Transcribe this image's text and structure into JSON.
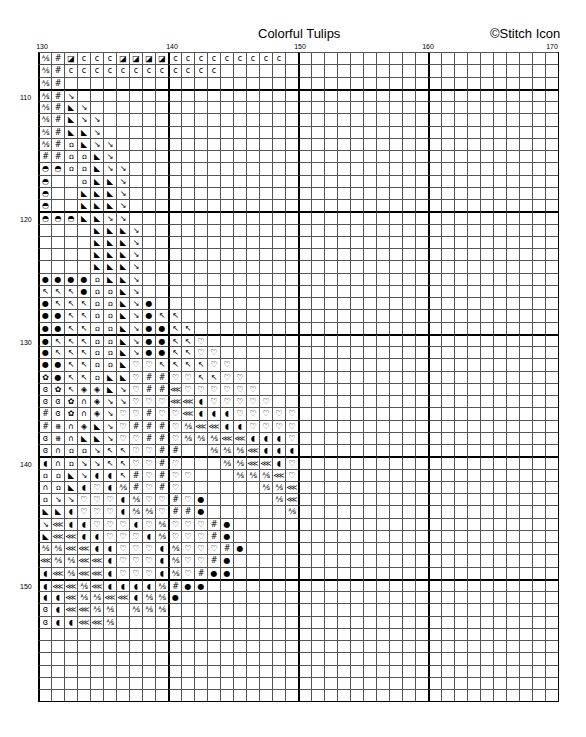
{
  "header": {
    "title": "Colorful Tulips",
    "copyright": "©Stitch Icon"
  },
  "columns": {
    "start": 130,
    "count": 40,
    "labels": [
      130,
      140,
      150,
      160,
      170
    ]
  },
  "rows": {
    "start": 107,
    "count": 53,
    "labels": [
      110,
      120,
      130,
      140,
      150
    ]
  },
  "symbols": {
    "X": "⅍",
    "#": "#",
    "Q": "◪",
    "C": "c",
    "D": "↘",
    "T": "◣",
    "U": "ꭥ",
    "M": "◓",
    "O": "●",
    "N": "↖",
    "H": "♡",
    "F": "✿",
    "S": "ɞ",
    "R": "◈",
    "n": "∩",
    "K": "⋘",
    "B": "◖",
    "P": "⧻",
    "_": ""
  },
  "pattern": [
    "X#QCCCQQQQCCCCCCCCC",
    "X#CCCCCCCCCCCC",
    "X#",
    "X#D",
    "X#TD",
    "X#TDD",
    "X#TTD",
    "X#UTDD",
    "##UUTD",
    "MMUUTDD",
    "M__UTTD",
    "M__TTTD",
    "M__TTTD",
    "MMMTTDD",
    "____TTTD",
    "____TTTD",
    "____TTTD",
    "____TTTD",
    "OOOOUTTD",
    "NNNOUUTD",
    "ONNNUUTDO",
    "OONNUUTDONN",
    "OONNUUTDOONN",
    "ONNNUUTDOONNH",
    "ONNNUUTDOONNHH",
    "OONNUUTHHNNNNHH",
    "FONNUTTH##HHNNHH",
    "SFNRRTDH##KHHHHHH",
    "SSFnRDDHHHKKBHHHHH",
    "#SFnRDHH#HHKBBBHHHHH",
    "#PnRTDH###HXKKBBHHHH",
    "SPnTTDHH##HXXXKKBBBH",
    "SnUUDNNHH##__XXXKBBB",
    "BnUDDNNHH#H___XXKKBH",
    "UUTDBBN#H#HH___XXXKH",
    "nUTBHBX#H#H______XXK",
    "UDDHHHBXHH#HO_____XK",
    "TTBHHHBXXH##O______X",
    "DKBBHHHBHXHHH#O",
    "TKKBBHHHBXHHH#O",
    "XXKKBBHHHBXHHH#O",
    "KXXKKBHHHBXHH#O",
    "BKXKKBHHHBXH#OO",
    "BKKXKBBBBX#OO",
    "BBKXXKKBXXO",
    "SBKKXX_XXX",
    "SBBKKX"
  ]
}
